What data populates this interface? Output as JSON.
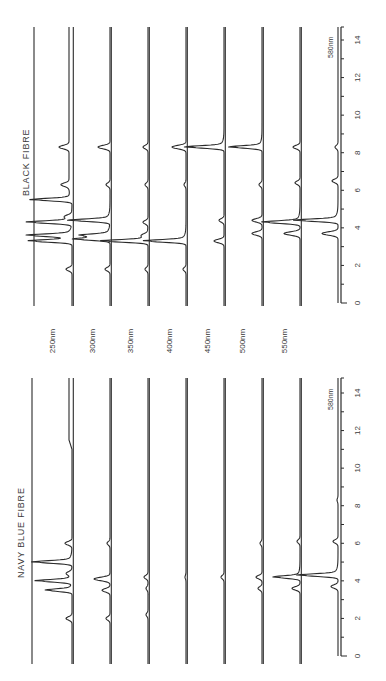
{
  "chart_data": [
    {
      "type": "line",
      "title": "BLACK FIBRE",
      "xlabel": "",
      "ylabel": "",
      "xlim": [
        0,
        14
      ],
      "x_ticks": [
        0,
        2,
        4,
        6,
        8,
        10,
        12,
        14
      ],
      "axis_trace_label": "580nm",
      "series": [
        {
          "name": "250nm",
          "peaks": [
            [
              1.8,
              6
            ],
            [
              3.3,
              37
            ],
            [
              3.6,
              37
            ],
            [
              4.3,
              38
            ],
            [
              4.6,
              6
            ],
            [
              5.5,
              34
            ],
            [
              6.3,
              8
            ],
            [
              8.3,
              10
            ]
          ],
          "drift_after": 5.6
        },
        {
          "name": "300nm",
          "peaks": [
            [
              1.8,
              5
            ],
            [
              3.4,
              30
            ],
            [
              3.6,
              24
            ],
            [
              4.4,
              34
            ],
            [
              6.3,
              4
            ],
            [
              8.3,
              12
            ]
          ]
        },
        {
          "name": "350nm",
          "peaks": [
            [
              1.8,
              3
            ],
            [
              3.3,
              40
            ],
            [
              3.6,
              5
            ],
            [
              4.3,
              5
            ],
            [
              6.3,
              3
            ],
            [
              8.3,
              5
            ]
          ]
        },
        {
          "name": "400nm",
          "peaks": [
            [
              1.8,
              3
            ],
            [
              3.3,
              36
            ],
            [
              6.3,
              2
            ],
            [
              8.3,
              14
            ]
          ]
        },
        {
          "name": "450nm",
          "peaks": [
            [
              3.3,
              10
            ],
            [
              4.4,
              5
            ],
            [
              8.3,
              32
            ]
          ]
        },
        {
          "name": "500nm",
          "peaks": [
            [
              3.7,
              10
            ],
            [
              4.4,
              10
            ],
            [
              6.3,
              3
            ],
            [
              8.3,
              27
            ]
          ]
        },
        {
          "name": "550nm",
          "peaks": [
            [
              3.7,
              16
            ],
            [
              4.3,
              32
            ],
            [
              6.4,
              5
            ],
            [
              8.3,
              7
            ]
          ]
        },
        {
          "name": "580nm",
          "peaks": [
            [
              3.7,
              16
            ],
            [
              4.4,
              36
            ],
            [
              6.5,
              6
            ],
            [
              8.3,
              3
            ]
          ]
        }
      ]
    },
    {
      "type": "line",
      "title": "NAVY BLUE FIBRE",
      "xlabel": "",
      "ylabel": "",
      "xlim": [
        0,
        14
      ],
      "x_ticks": [
        0,
        2,
        4,
        6,
        8,
        10,
        12,
        14
      ],
      "axis_trace_label": "580nm",
      "series": [
        {
          "name": "250nm",
          "peaks": [
            [
              2.0,
              6
            ],
            [
              3.5,
              22
            ],
            [
              4.0,
              30
            ],
            [
              4.4,
              5
            ],
            [
              5.0,
              33
            ],
            [
              6.0,
              7
            ]
          ],
          "drift_after": 11.0
        },
        {
          "name": "300nm",
          "peaks": [
            [
              2.0,
              4
            ],
            [
              3.5,
              8
            ],
            [
              4.1,
              16
            ],
            [
              6.0,
              3
            ]
          ]
        },
        {
          "name": "350nm",
          "peaks": [
            [
              2.2,
              2
            ],
            [
              3.6,
              2
            ],
            [
              4.2,
              4
            ]
          ]
        },
        {
          "name": "400nm",
          "peaks": [
            [
              4.2,
              1
            ]
          ]
        },
        {
          "name": "450nm",
          "peaks": [
            [
              4.2,
              3
            ]
          ]
        },
        {
          "name": "500nm",
          "peaks": [
            [
              3.6,
              4
            ],
            [
              4.2,
              6
            ],
            [
              6.0,
              2
            ]
          ]
        },
        {
          "name": "550nm",
          "peaks": [
            [
              3.6,
              8
            ],
            [
              4.2,
              22
            ],
            [
              6.1,
              3
            ]
          ]
        },
        {
          "name": "580nm",
          "peaks": [
            [
              3.7,
              7
            ],
            [
              4.3,
              34
            ],
            [
              6.1,
              5
            ],
            [
              8.3,
              1
            ]
          ]
        }
      ]
    }
  ],
  "wavelength_labels": [
    "250nm",
    "300nm",
    "350nm",
    "400nm",
    "450nm",
    "500nm",
    "550nm"
  ],
  "panels": {
    "black": {
      "title": "BLACK FIBRE",
      "axis_label": "580nm"
    },
    "navy": {
      "title": "NAVY BLUE FIBRE",
      "axis_label": "580nm"
    }
  },
  "tick_labels": [
    "0",
    "2",
    "4",
    "6",
    "8",
    "10",
    "12",
    "14"
  ]
}
